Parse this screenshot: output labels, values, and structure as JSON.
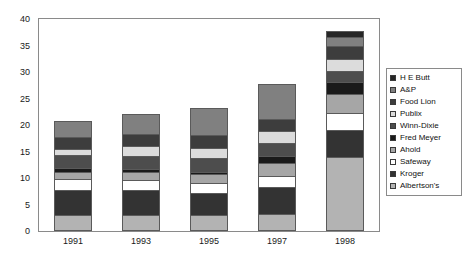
{
  "chart_data": {
    "type": "bar",
    "subtype": "stacked-bar",
    "title": "",
    "subtitle": "",
    "xlabel": "",
    "ylabel": "",
    "categories": [
      "1991",
      "1993",
      "1995",
      "1997",
      "1998"
    ],
    "ylim": [
      0,
      40
    ],
    "ytick_values": [
      0,
      5,
      10,
      15,
      20,
      25,
      30,
      35,
      40
    ],
    "ytick_labels": [
      "0",
      "5",
      "10",
      "15",
      "20",
      "25",
      "30",
      "35",
      "40"
    ],
    "grid": false,
    "legend_position": "right",
    "stack_order_bottom_to_top": [
      "Albertson's",
      "Kroger",
      "Safeway",
      "Ahold",
      "Fred Meyer",
      "Winn-Dixie",
      "Publix",
      "Food Lion",
      "A&P",
      "H E Butt"
    ],
    "series": [
      {
        "name": "Albertson's",
        "color": "#b3b3b3",
        "values": [
          3.0,
          3.1,
          3.1,
          3.3,
          14.0
        ]
      },
      {
        "name": "Kroger",
        "color": "#333333",
        "values": [
          4.8,
          4.6,
          4.1,
          5.0,
          5.1
        ]
      },
      {
        "name": "Safeway",
        "color": "#ffffff",
        "values": [
          2.1,
          2.0,
          1.9,
          2.0,
          3.2
        ]
      },
      {
        "name": "Ahold",
        "color": "#a6a6a6",
        "values": [
          1.3,
          1.4,
          1.6,
          2.6,
          3.5
        ]
      },
      {
        "name": "Fred Meyer",
        "color": "#1a1a1a",
        "values": [
          0.6,
          0.6,
          0.5,
          1.2,
          2.4
        ]
      },
      {
        "name": "Winn-Dixie",
        "color": "#4d4d4d",
        "values": [
          2.5,
          2.4,
          2.6,
          2.6,
          2.0
        ]
      },
      {
        "name": "Publix",
        "color": "#dcdcdc",
        "values": [
          1.2,
          1.9,
          1.9,
          2.1,
          2.2
        ]
      },
      {
        "name": "Food Lion",
        "color": "#3d3d3d",
        "values": [
          2.2,
          2.3,
          2.4,
          2.3,
          2.5
        ]
      },
      {
        "name": "A&P",
        "color": "#808080",
        "values": [
          3.1,
          3.8,
          5.2,
          6.7,
          1.7
        ]
      },
      {
        "name": "H E Butt",
        "color": "#262626",
        "values": [
          0.0,
          0.0,
          0.0,
          0.0,
          1.2
        ]
      }
    ],
    "totals": [
      20.8,
      22.1,
      23.3,
      27.8,
      37.8
    ]
  },
  "legend": {
    "items": [
      {
        "label": "H E Butt",
        "swatch": "legend-swatch-h-e-butt"
      },
      {
        "label": "A&P",
        "swatch": "legend-swatch-a-and-p"
      },
      {
        "label": "Food Lion",
        "swatch": "legend-swatch-food-lion"
      },
      {
        "label": "Publix",
        "swatch": "legend-swatch-publix"
      },
      {
        "label": "Winn-Dixie",
        "swatch": "legend-swatch-winn-dixie"
      },
      {
        "label": "Fred Meyer",
        "swatch": "legend-swatch-fred-meyer"
      },
      {
        "label": "Ahold",
        "swatch": "legend-swatch-ahold"
      },
      {
        "label": "Safeway",
        "swatch": "legend-swatch-safeway"
      },
      {
        "label": "Kroger",
        "swatch": "legend-swatch-kroger"
      },
      {
        "label": "Albertson's",
        "swatch": "legend-swatch-albertsons"
      }
    ]
  },
  "colors": {
    "frame": "#8a8a8a",
    "segment_border": "#5a5a5a",
    "text": "#1a1a1a",
    "background": "#ffffff"
  }
}
